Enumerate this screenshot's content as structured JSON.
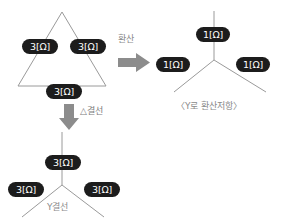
{
  "diagram": {
    "title_delta_label": "△결선",
    "title_y_label": "Y결선",
    "conversion_label": "환산",
    "y_result_caption": "〈Y로 환산저항〉",
    "colors": {
      "pill_fill": "#1c1c1c",
      "pill_text": "#ffffff",
      "line": "#9a9a9a",
      "arrow": "#8c8c8c",
      "caption_text": "#8a8a8a",
      "background": "#ffffff"
    },
    "delta_network": {
      "name": "delta-triangle",
      "resistors": [
        {
          "id": "delta-left",
          "value": "3[Ω]"
        },
        {
          "id": "delta-right",
          "value": "3[Ω]"
        },
        {
          "id": "delta-bottom",
          "value": "3[Ω]"
        }
      ]
    },
    "y_network_converted": {
      "name": "y-converted",
      "resistors": [
        {
          "id": "y-conv-top",
          "value": "1[Ω]"
        },
        {
          "id": "y-conv-left",
          "value": "1[Ω]"
        },
        {
          "id": "y-conv-right",
          "value": "1[Ω]"
        }
      ]
    },
    "y_network_bottom": {
      "name": "y-bottom",
      "resistors": [
        {
          "id": "y-bot-top",
          "value": "3[Ω]"
        },
        {
          "id": "y-bot-left",
          "value": "3[Ω]"
        },
        {
          "id": "y-bot-right",
          "value": "3[Ω]"
        }
      ]
    },
    "arrows": [
      {
        "id": "arrow-right",
        "direction": "right",
        "label": "환산"
      },
      {
        "id": "arrow-down",
        "direction": "down",
        "label": "△결선"
      }
    ]
  }
}
